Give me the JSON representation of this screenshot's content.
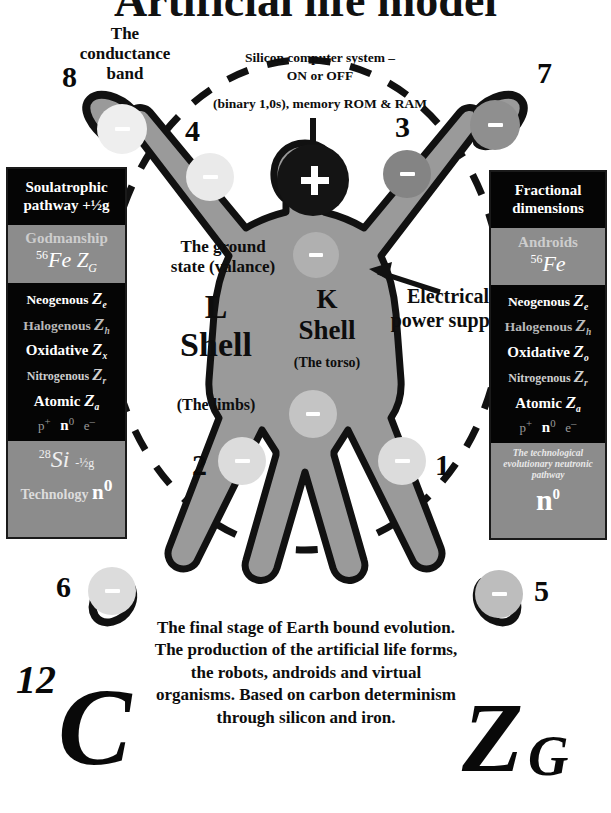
{
  "title": "Artificial life model",
  "annotations": {
    "conductance_band": "The\nconductance\nband",
    "silicon_system_line1": "Silicon computer system –",
    "silicon_system_line2": "ON or OFF",
    "silicon_system_line3": "(binary 1,0s), memory ROM & RAM",
    "ground_state": "The ground\nstate (valance)",
    "l_shell": "L\nShell",
    "l_shell_sub": "(The limbs)",
    "k_shell": "K\nShell",
    "k_shell_sub": "(The torso)",
    "power_supply": "Electrical\npower supply",
    "nucleus_charge": "+",
    "bottom_paragraph": "The final stage of Earth bound evolution. The production of the artificial life forms, the robots, androids and virtual organisms. Based on carbon determinism through silicon and iron."
  },
  "electrons": [
    {
      "id": "electron-1",
      "label": "1",
      "charge": "–"
    },
    {
      "id": "electron-2",
      "label": "2",
      "charge": "–"
    },
    {
      "id": "electron-3",
      "label": "3",
      "charge": "–"
    },
    {
      "id": "electron-4",
      "label": "4",
      "charge": "–"
    },
    {
      "id": "electron-5",
      "label": "5",
      "charge": "–"
    },
    {
      "id": "electron-6",
      "label": "6",
      "charge": "–"
    },
    {
      "id": "electron-7",
      "label": "7",
      "charge": "–"
    },
    {
      "id": "electron-8",
      "label": "8",
      "charge": "–"
    },
    {
      "id": "electron-k-upper",
      "label": "",
      "charge": "–"
    },
    {
      "id": "electron-k-lower",
      "label": "",
      "charge": "–"
    }
  ],
  "left_box": {
    "header": "Soulatrophic pathway +½g",
    "subtitle": "Godmanship",
    "isotope_mass": "56",
    "isotope_symbol": "Fe",
    "isotope_z": "Z",
    "isotope_z_sub": "G",
    "rows": [
      {
        "name": "Neogenous",
        "z": "Z",
        "sub": "e",
        "style": "bright"
      },
      {
        "name": "Halogenous",
        "z": "Z",
        "sub": "h",
        "style": "dim"
      },
      {
        "name": "Oxidative",
        "z": "Z",
        "sub": "x",
        "style": "bright"
      },
      {
        "name": "Nitrogenous",
        "z": "Z",
        "sub": "r",
        "style": "mid"
      },
      {
        "name": "Atomic",
        "z": "Z",
        "sub": "a",
        "style": "bright"
      }
    ],
    "particles": [
      "p",
      "n",
      "e"
    ],
    "particles_sup": [
      "+",
      "0",
      "–"
    ],
    "footer_isotope_mass": "28",
    "footer_isotope_symbol": "Si",
    "footer_spin": "-½g",
    "footer_label": "Technology",
    "footer_n": "n",
    "footer_n_sup": "0"
  },
  "right_box": {
    "header": "Fractional dimensions",
    "subtitle": "Androids",
    "isotope_mass": "56",
    "isotope_symbol": "Fe",
    "rows": [
      {
        "name": "Neogenous",
        "z": "Z",
        "sub": "e",
        "style": "bright"
      },
      {
        "name": "Halogenous",
        "z": "Z",
        "sub": "h",
        "style": "dim"
      },
      {
        "name": "Oxidative",
        "z": "Z",
        "sub": "o",
        "style": "bright"
      },
      {
        "name": "Nitrogenous",
        "z": "Z",
        "sub": "r",
        "style": "mid"
      },
      {
        "name": "Atomic",
        "z": "Z",
        "sub": "a",
        "style": "bright"
      }
    ],
    "particles": [
      "p",
      "n",
      "e"
    ],
    "particles_sup": [
      "+",
      "0",
      "–"
    ],
    "footer_caption": "The technological evolutionary neutronic pathway",
    "footer_n": "n",
    "footer_n_sup": "0"
  },
  "big_glyphs": {
    "carbon_mass": "12",
    "carbon_symbol": "C",
    "zg_symbol": "Z",
    "zg_sub": "G"
  },
  "colors": {
    "body_fill": "#9a9a9a",
    "outline": "#111111",
    "nucleus": "#141414",
    "electron_light": "#e2e2e2",
    "electron_pale": "#d0d0d0",
    "electron_dark": "#8a8a8a",
    "box_gray": "#8c8c8c",
    "box_black": "#050505",
    "background": "#ffffff"
  }
}
